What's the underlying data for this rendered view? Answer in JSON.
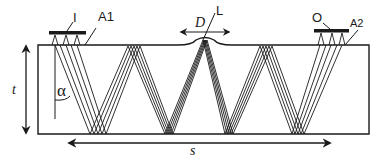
{
  "diagram": {
    "type": "ultrasonic-ray-path-schematic",
    "labels": {
      "input_transducer": "I",
      "input_array": "A1",
      "output_transducer": "O",
      "output_array": "A2",
      "defect_width": "D",
      "lens_focus": "L",
      "thickness": "t",
      "angle": "α",
      "span": "s"
    },
    "colors": {
      "stroke": "#1a1a1a",
      "background": "#ffffff"
    },
    "geometry": {
      "slab": {
        "x": 38,
        "y": 45,
        "width": 331,
        "height": 89
      },
      "bump": {
        "x_start": 178,
        "x_end": 232,
        "peak_y": 37
      },
      "input_bar": {
        "x1": 50,
        "x2": 85,
        "y": 33
      },
      "output_bar": {
        "x1": 314,
        "x2": 349,
        "y": 31
      },
      "thickness_arrow": {
        "x": 26,
        "y1": 44,
        "y2": 134
      },
      "span_arrow": {
        "y": 143,
        "x1": 67,
        "x2": 332
      }
    }
  }
}
